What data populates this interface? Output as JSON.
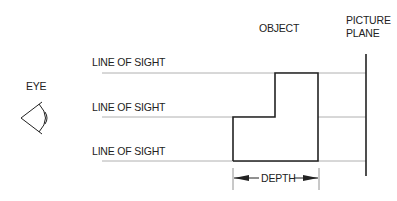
{
  "labels": {
    "eye": "EYE",
    "object": "OBJECT",
    "picture_plane_line1": "PICTURE",
    "picture_plane_line2": "PLANE",
    "line_of_sight_1": "LINE OF SIGHT",
    "line_of_sight_2": "LINE OF SIGHT",
    "line_of_sight_3": "LINE OF SIGHT",
    "depth": "DEPTH"
  },
  "colors": {
    "object_stroke": "#222222",
    "sight_line": "#b0b0b0",
    "picture_plane": "#222222"
  }
}
